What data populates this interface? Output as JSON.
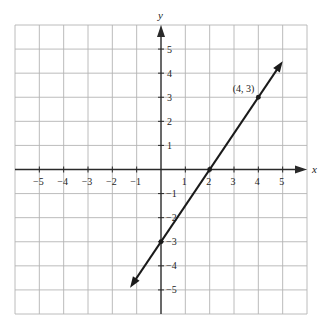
{
  "chart_data": {
    "type": "line",
    "title": "",
    "xlabel": "x",
    "ylabel": "y",
    "xlim": [
      -6,
      6
    ],
    "ylim": [
      -6,
      6
    ],
    "grid": true,
    "x_ticks": [
      -5,
      -4,
      -3,
      -2,
      -1,
      1,
      2,
      3,
      4,
      5
    ],
    "y_ticks": [
      5,
      4,
      3,
      2,
      1,
      -1,
      -2,
      -3,
      -4,
      -5
    ],
    "x_tick_labels": [
      "−5",
      "−4",
      "−3",
      "−2",
      "−1",
      "1",
      "2",
      "3",
      "4",
      "5"
    ],
    "y_tick_labels": [
      "5",
      "4",
      "3",
      "2",
      "1",
      "−1",
      "−2",
      "−3",
      "−4",
      "−5"
    ],
    "series": [
      {
        "name": "line",
        "equation": "y = 1.5x - 3",
        "slope": 1.5,
        "intercept": -3,
        "x_range": [
          -1.27,
          5.0
        ],
        "endpoints_arrows": true
      }
    ],
    "points": [
      {
        "x": 0,
        "y": -3,
        "label": ""
      },
      {
        "x": 2,
        "y": 0,
        "label": ""
      },
      {
        "x": 4,
        "y": 3,
        "label": "(4, 3)"
      }
    ],
    "legend": null
  },
  "labels": {
    "x_axis": "x",
    "y_axis": "y",
    "point_4_3": "(4, 3)"
  },
  "colors": {
    "grid": "#b4b4b4",
    "axis": "#2a2a2a",
    "line": "#1a1a1a",
    "text": "#222222"
  }
}
